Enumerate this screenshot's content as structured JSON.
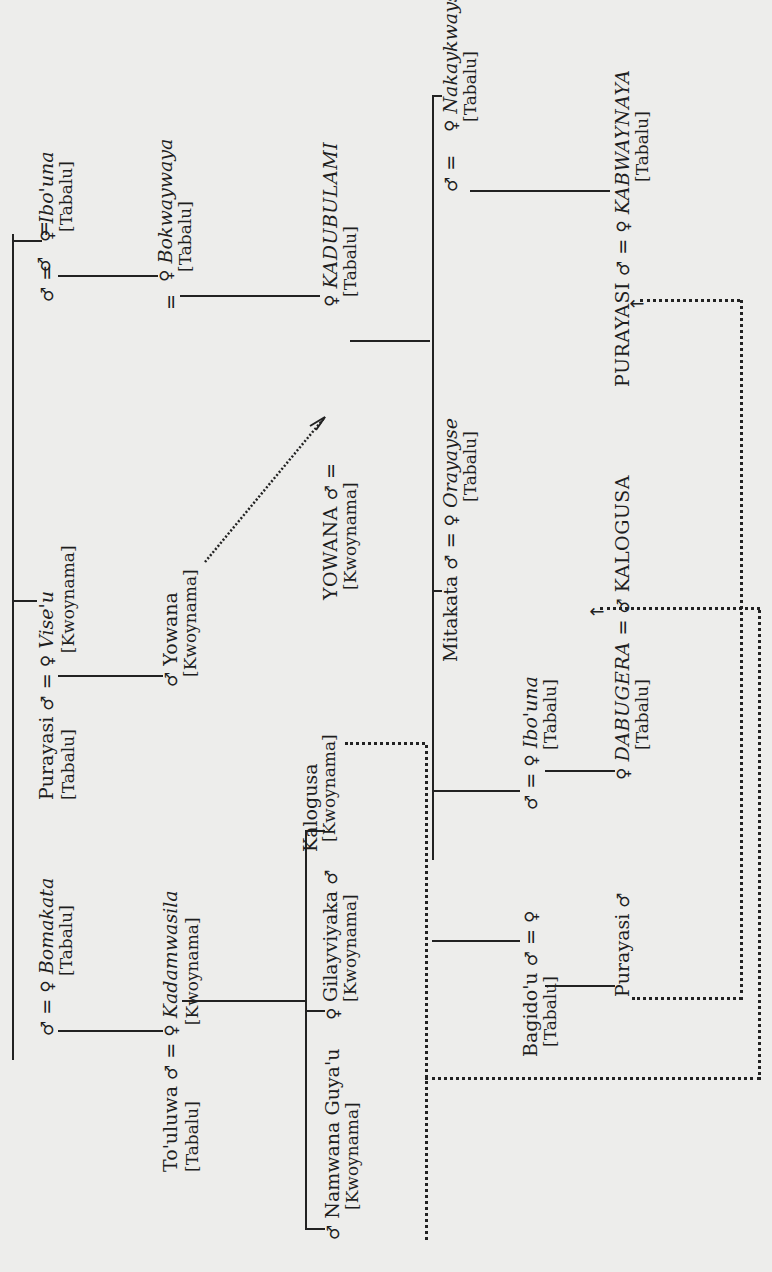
{
  "diagram": {
    "orientation": "page rotated 90 degrees counter-clockwise",
    "symbols": {
      "male": "♂",
      "female": "♀",
      "married": "="
    },
    "row_top": {
      "left_couple": {
        "male_sym": "♂",
        "eq": "=",
        "female_sym": "♀",
        "female_name": "Ibo'una",
        "female_clan": "[Tabalu]"
      },
      "child": {
        "sym": "♀",
        "name": "Bokwaywaya",
        "clan": "[Tabalu]",
        "spouse_eq": "="
      },
      "grandchild": {
        "sym": "♀",
        "name": "KADUBULAMI",
        "clan": "[Tabalu]"
      },
      "husband_of_kadubulami": {
        "name": "YOWANA",
        "clan": "[Kwoynama]",
        "sym": "♂",
        "eq": "="
      }
    },
    "siblings_of_kadubulami_children": [
      {
        "name": "Nakaykwayse",
        "clan": "[Tabalu]",
        "sym": "♀",
        "husband_sym": "♂",
        "eq": "="
      },
      {
        "name": "KABWAYNAYA",
        "clan": "[Tabalu]",
        "sym": "♀",
        "husband_name": "PURAYASI",
        "husband_sym": "♂",
        "eq": "="
      },
      {
        "name": "Mitakata",
        "sym": "♂",
        "eq": "=",
        "wife_sym": "♀",
        "wife_name": "Orayayse",
        "wife_clan": "[Tabalu]"
      },
      {
        "name": "Ibo'una",
        "clan": "[Tabalu]",
        "sym": "♀",
        "husband_sym": "♂",
        "eq": "="
      },
      {
        "name": "DABUGERA",
        "clan": "[Tabalu]",
        "sym": "♀",
        "husband_name": "KALOGUSA",
        "husband_sym": "♂",
        "eq": "="
      },
      {
        "name": "Bagido'u",
        "clan": "[Tabalu]",
        "sym": "♂",
        "eq": "=",
        "wife_sym": "♀"
      },
      {
        "name": "Purayasi",
        "sym": "♂"
      }
    ],
    "left_branch": {
      "purayasi": {
        "name": "Purayasi",
        "clan": "[Tabalu]",
        "sym": "♂",
        "eq": "=",
        "wife_sym": "♀",
        "wife_name": "Vise'u",
        "wife_clan": "[Kwoynama]"
      },
      "yowana": {
        "name": "Yowana",
        "clan": "[Kwoynama]",
        "sym": "♂"
      },
      "bomakata": {
        "husband_sym": "♂",
        "eq": "=",
        "sym": "♀",
        "name": "Bomakata",
        "clan": "[Tabalu]"
      },
      "touluwa": {
        "name": "To'uluwa",
        "clan": "[Tabalu]",
        "sym": "♂",
        "eq": "=",
        "wife_sym": "♀",
        "wife_name": "Kadamwasila",
        "wife_clan": "[Kwoynama]"
      },
      "children": [
        {
          "name": "Gilayviyaka",
          "clan": "[Kwoynama]",
          "sym": "♂"
        },
        {
          "name": "Kalogusa",
          "clan": "[Kwoynama]"
        },
        {
          "name": "Namwana Guya'u",
          "clan": "[Kwoynama]",
          "sym": "♂"
        },
        {
          "sym": "♀"
        }
      ]
    },
    "arrows": [
      {
        "from": "Yowana",
        "to": "YOWANA",
        "style": "dotted"
      },
      {
        "from": "Kalogusa",
        "to": "KALOGUSA",
        "style": "dotted"
      },
      {
        "from": "Purayasi",
        "to": "PURAYASI",
        "style": "dotted"
      }
    ]
  }
}
